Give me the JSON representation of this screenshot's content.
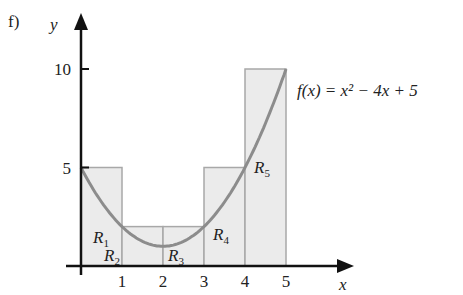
{
  "part_label": "f)",
  "chart_data": {
    "type": "bar",
    "title": "",
    "xlabel": "x",
    "ylabel": "y",
    "function_label": "f(x) = x² − 4x + 5",
    "function": {
      "a": 1,
      "b": -4,
      "c": 5
    },
    "x_ticks": [
      "1",
      "2",
      "3",
      "4",
      "5"
    ],
    "y_ticks": [
      "5",
      "10"
    ],
    "xlim": [
      0,
      5
    ],
    "ylim": [
      0,
      10
    ],
    "grid": false,
    "rectangles": [
      {
        "name": "R1",
        "x0": 0,
        "x1": 1,
        "height": 5
      },
      {
        "name": "R2",
        "x0": 1,
        "x1": 2,
        "height": 2
      },
      {
        "name": "R3",
        "x0": 2,
        "x1": 3,
        "height": 2
      },
      {
        "name": "R4",
        "x0": 3,
        "x1": 4,
        "height": 5
      },
      {
        "name": "R5",
        "x0": 4,
        "x1": 5,
        "height": 10
      }
    ],
    "colors": {
      "rect_fill": "#ebebeb",
      "rect_stroke": "#a8a8a8",
      "curve": "#8c8c8c",
      "axis": "#111111",
      "function_label": "#8a8a8a"
    }
  }
}
